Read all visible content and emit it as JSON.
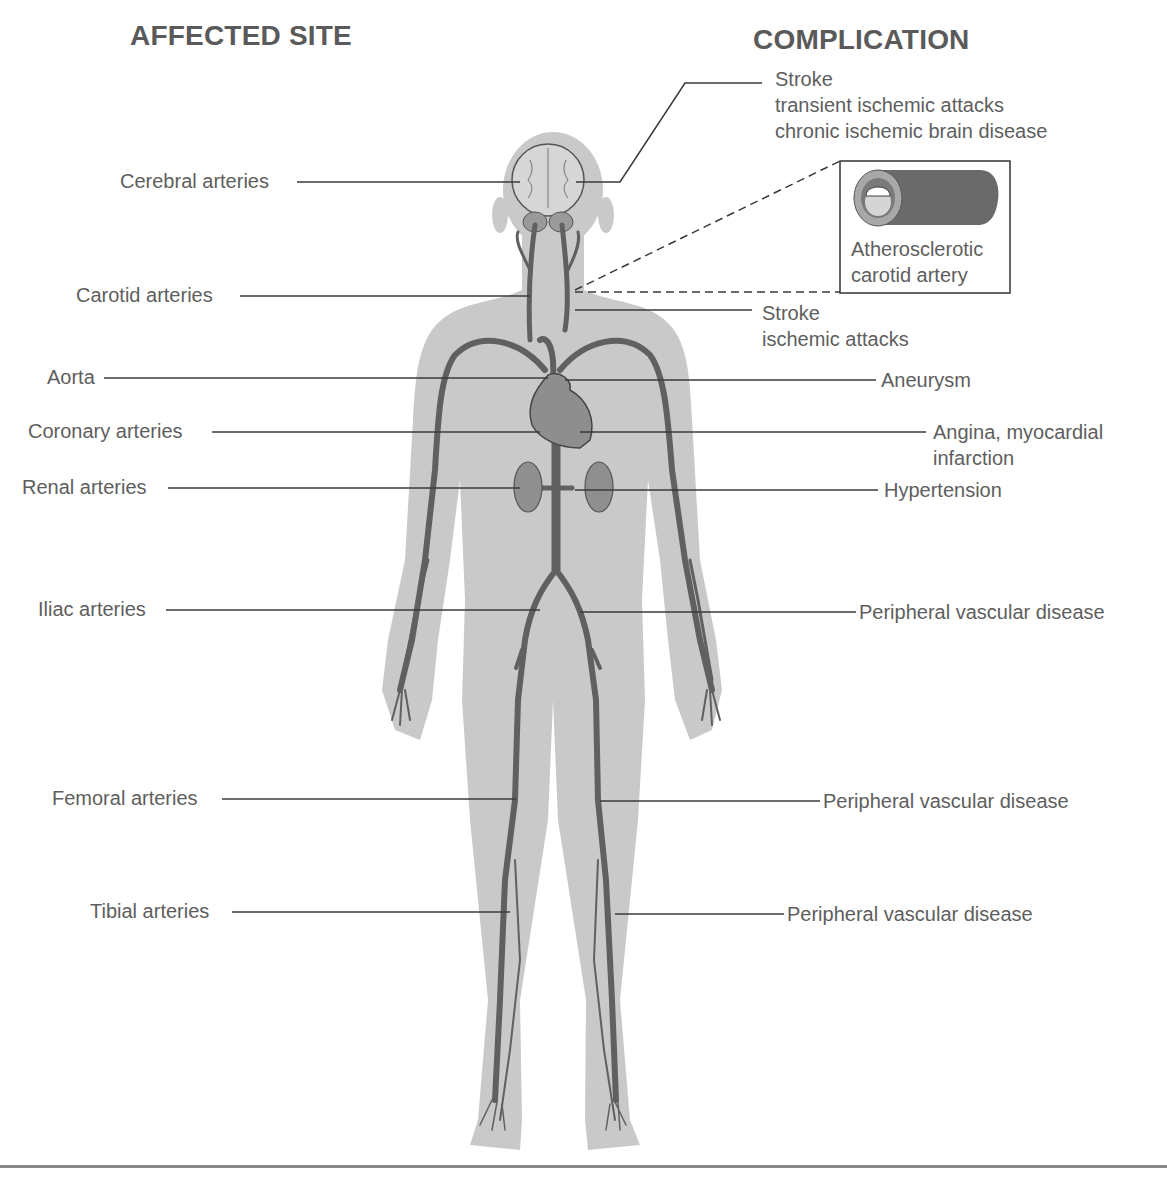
{
  "headings": {
    "affected_site": "AFFECTED SITE",
    "complication": "COMPLICATION"
  },
  "affected_sites": [
    {
      "label": "Cerebral arteries"
    },
    {
      "label": "Carotid arteries"
    },
    {
      "label": "Aorta"
    },
    {
      "label": "Coronary arteries"
    },
    {
      "label": "Renal arteries"
    },
    {
      "label": "Iliac arteries"
    },
    {
      "label": "Femoral arteries"
    },
    {
      "label": "Tibial arteries"
    }
  ],
  "complications": [
    {
      "lines": [
        "Stroke",
        "transient ischemic attacks",
        "chronic ischemic brain disease"
      ]
    },
    {
      "lines": [
        "Stroke",
        "ischemic attacks"
      ]
    },
    {
      "lines": [
        "Aneurysm"
      ]
    },
    {
      "lines": [
        "Angina, myocardial",
        "infarction"
      ]
    },
    {
      "lines": [
        "Hypertension"
      ]
    },
    {
      "lines": [
        "Peripheral vascular disease"
      ]
    },
    {
      "lines": [
        "Peripheral vascular disease"
      ]
    },
    {
      "lines": [
        "Peripheral vascular disease"
      ]
    }
  ],
  "inset": {
    "lines": [
      "Atherosclerotic",
      "carotid artery"
    ],
    "icon": "artery-cross-section-icon"
  },
  "colors": {
    "silhouette": "#c8c8c8",
    "vessel": "#5f5f5f",
    "organ": "#8c8c8c",
    "leader_line": "#333333",
    "text": "#5e5e5e"
  }
}
